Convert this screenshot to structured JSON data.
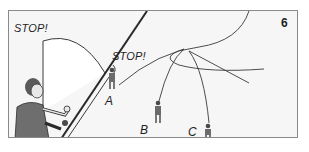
{
  "figure": {
    "number": "6",
    "labels": {
      "stop_top": "STOP!",
      "stop_mid": "STOP!",
      "a": "A",
      "b": "B",
      "c": "C"
    },
    "colors": {
      "background": "#f6f6f6",
      "border": "#8a8a8a",
      "line": "#3a3a3a",
      "text": "#1e1e1e",
      "vest": "#6e6e6e"
    }
  }
}
